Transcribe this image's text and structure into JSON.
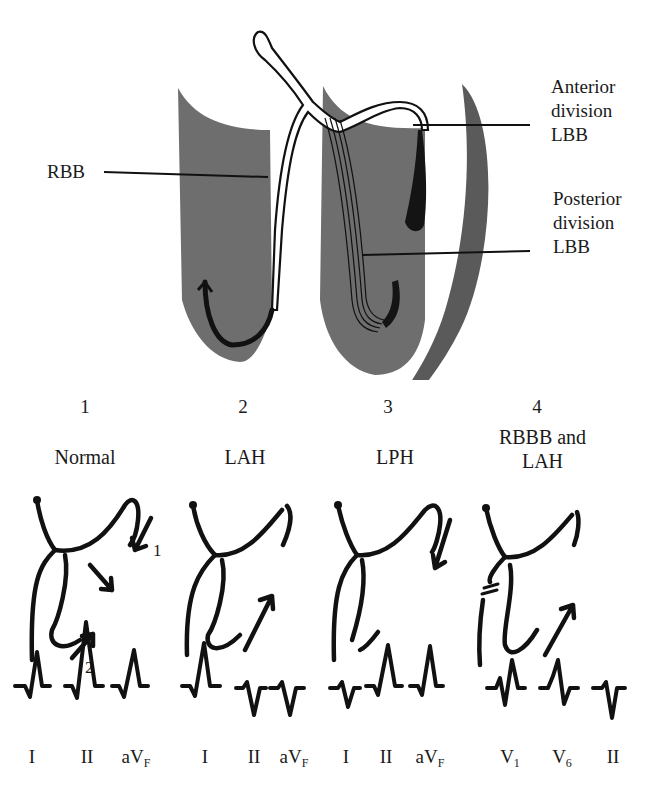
{
  "anatomy": {
    "labels": {
      "rbb": "RBB",
      "anterior": [
        "Anterior",
        "division",
        "LBB"
      ],
      "posterior": [
        "Posterior",
        "division",
        "LBB"
      ]
    },
    "colors": {
      "muscle": "#6e6e6e",
      "line": "#111111",
      "background": "#ffffff"
    }
  },
  "panels": [
    {
      "number": "1",
      "title": [
        "Normal"
      ],
      "arrow_labels": [
        "1",
        "2"
      ],
      "leads": [
        {
          "name": "I",
          "sub": ""
        },
        {
          "name": "II",
          "sub": ""
        },
        {
          "name": "aV",
          "sub": "F"
        }
      ]
    },
    {
      "number": "2",
      "title": [
        "LAH"
      ],
      "leads": [
        {
          "name": "I",
          "sub": ""
        },
        {
          "name": "II",
          "sub": ""
        },
        {
          "name": "aV",
          "sub": "F"
        }
      ]
    },
    {
      "number": "3",
      "title": [
        "LPH"
      ],
      "leads": [
        {
          "name": "I",
          "sub": ""
        },
        {
          "name": "II",
          "sub": ""
        },
        {
          "name": "aV",
          "sub": "F"
        }
      ]
    },
    {
      "number": "4",
      "title": [
        "RBBB and",
        "LAH"
      ],
      "leads": [
        {
          "name": "V",
          "sub": "1"
        },
        {
          "name": "V",
          "sub": "6"
        },
        {
          "name": "II",
          "sub": ""
        }
      ]
    }
  ]
}
